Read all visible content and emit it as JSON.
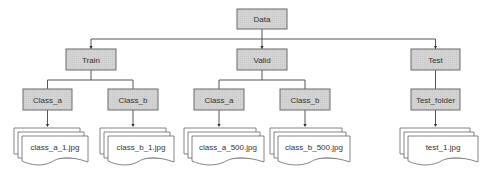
{
  "diagram": {
    "type": "folder-tree",
    "root": {
      "id": "data",
      "label": "Data",
      "children": [
        {
          "id": "train",
          "label": "Train",
          "children": [
            {
              "id": "train-class-a",
              "label": "Class_a",
              "file": "class_a_1.jpg"
            },
            {
              "id": "train-class-b",
              "label": "Class_b",
              "file": "class_b_1.jpg"
            }
          ]
        },
        {
          "id": "valid",
          "label": "Valid",
          "children": [
            {
              "id": "valid-class-a",
              "label": "Class_a",
              "file": "class_a_500.jpg"
            },
            {
              "id": "valid-class-b",
              "label": "Class_b",
              "file": "class_b_500.jpg"
            }
          ]
        },
        {
          "id": "test",
          "label": "Test",
          "children": [
            {
              "id": "test-folder",
              "label": "Test_folder",
              "file": "test_1.jpg"
            }
          ]
        }
      ]
    },
    "colors": {
      "node_fill": "#d2d2d2",
      "node_stroke": "#6a6a6a",
      "edge": "#555555",
      "text": "#333333"
    }
  }
}
